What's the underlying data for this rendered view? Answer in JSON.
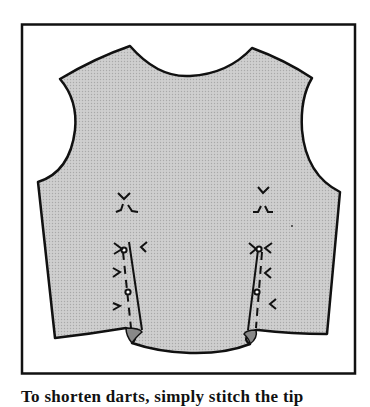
{
  "figure": {
    "fill_color": "#c9c9c9",
    "outline_color": "#111111",
    "frame_color": "#111111",
    "background_color": "#ffffff",
    "markings": {
      "left_dart": {
        "notches": 6,
        "pin_dots": 2
      },
      "right_dart": {
        "notches": 6,
        "pin_dots": 2
      }
    }
  },
  "caption": {
    "text": "To shorten darts, simply stitch the tip"
  }
}
